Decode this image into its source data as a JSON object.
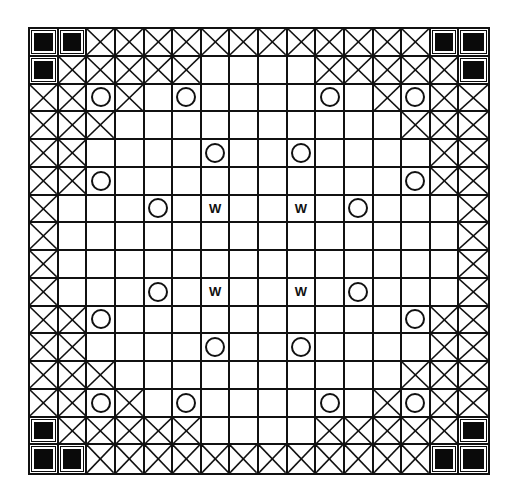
{
  "board": {
    "size": 16,
    "legend": {
      "B": "blocked-filled-square",
      "X": "crossed-square",
      "O": "circle",
      "W": "letter-W",
      ".": "empty"
    },
    "w_label": "W",
    "rows": [
      "BBXXXXXXXXXXXXBB",
      "BXXXXX....XXXXXB",
      "XXOX.O....O.XOXX",
      "XXX..........XXX",
      "XX....O..O....XX",
      "XXO..........OXX",
      "X...O.W..W.O...X",
      "X..............X",
      "X..............X",
      "X...O.W..W.O...X",
      "XXO..........OXX",
      "XX....O..O....XX",
      "XXX..........XXX",
      "XXOX.O....O.XOXX",
      "BXXXXX....XXXXXB",
      "BBXXXXXXXXXXXXBB"
    ],
    "colors": {
      "line": "#111111",
      "fill": "#0a0a0a",
      "background": "#ffffff"
    }
  }
}
